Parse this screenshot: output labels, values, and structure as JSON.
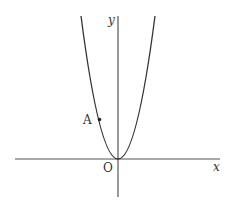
{
  "figure": {
    "type": "coordinate-plane-parabola",
    "axes": {
      "x_label": "x",
      "y_label": "y",
      "origin_label": "O"
    },
    "curve": {
      "description": "upward-opening parabola with vertex at origin",
      "color": "#333333"
    },
    "points": [
      {
        "label": "A",
        "on": "left branch of parabola"
      }
    ],
    "colors": {
      "axis": "#555555",
      "curve": "#333333",
      "text": "#333333"
    }
  }
}
